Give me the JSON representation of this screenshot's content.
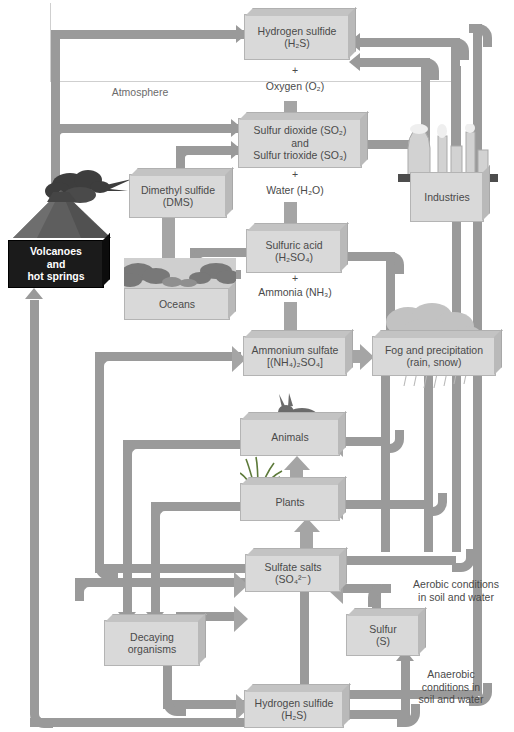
{
  "diagram": {
    "colors": {
      "box_fill": "#d9d9d9",
      "box_dark_fill": "#1b1b1b",
      "arrow": "#9a9a9a",
      "reaction_arrow": "#a5a5a5",
      "text": "#4a4a4a"
    }
  },
  "nodes": {
    "hydrogen_sulfide_top": {
      "line1": "Hydrogen sulfide",
      "line2": "(H₂S)"
    },
    "sulfur_oxides": {
      "line1": "Sulfur dioxide (SO₂)",
      "line2": "and",
      "line3": "Sulfur trioxide (SO₃)"
    },
    "dimethyl_sulfide": {
      "line1": "Dimethyl sulfide",
      "line2": "(DMS)"
    },
    "sulfuric_acid": {
      "line1": "Sulfuric acid",
      "line2": "(H₂SO₄)"
    },
    "oceans": {
      "line1": "Oceans"
    },
    "industries": {
      "line1": "Industries"
    },
    "volcanoes": {
      "line1": "Volcanoes",
      "line2": "and",
      "line3": "hot springs"
    },
    "ammonium_sulfate": {
      "line1": "Ammonium sulfate",
      "line2": "[(NH₄)₂SO₄]"
    },
    "fog_precipitation": {
      "line1": "Fog and precipitation",
      "line2": "(rain, snow)"
    },
    "animals": {
      "line1": "Animals"
    },
    "plants": {
      "line1": "Plants"
    },
    "sulfate_salts": {
      "line1": "Sulfate salts",
      "line2": "(SO₄²⁻)"
    },
    "decaying_organisms": {
      "line1": "Decaying",
      "line2": "organisms"
    },
    "sulfur": {
      "line1": "Sulfur",
      "line2": "(S)"
    },
    "hydrogen_sulfide_bottom": {
      "line1": "Hydrogen sulfide",
      "line2": "(H₂S)"
    }
  },
  "labels": {
    "atmosphere": "Atmosphere",
    "plus_1": "+",
    "oxygen": "Oxygen (O₂)",
    "plus_2": "+",
    "water": "Water (H₂O)",
    "plus_3": "+",
    "ammonia": "Ammonia (NH₃)",
    "aerobic_line1": "Aerobic conditions",
    "aerobic_line2": "in soil and water",
    "anaerobic_line1": "Anaerobic",
    "anaerobic_line2": "conditions in",
    "anaerobic_line3": "soil and water"
  },
  "artwork": [
    {
      "name": "volcano-illustration"
    },
    {
      "name": "ocean-waves-illustration"
    },
    {
      "name": "factory-smokestacks-illustration"
    },
    {
      "name": "rain-cloud-illustration"
    },
    {
      "name": "rabbit-illustration"
    },
    {
      "name": "grass-illustration"
    }
  ]
}
